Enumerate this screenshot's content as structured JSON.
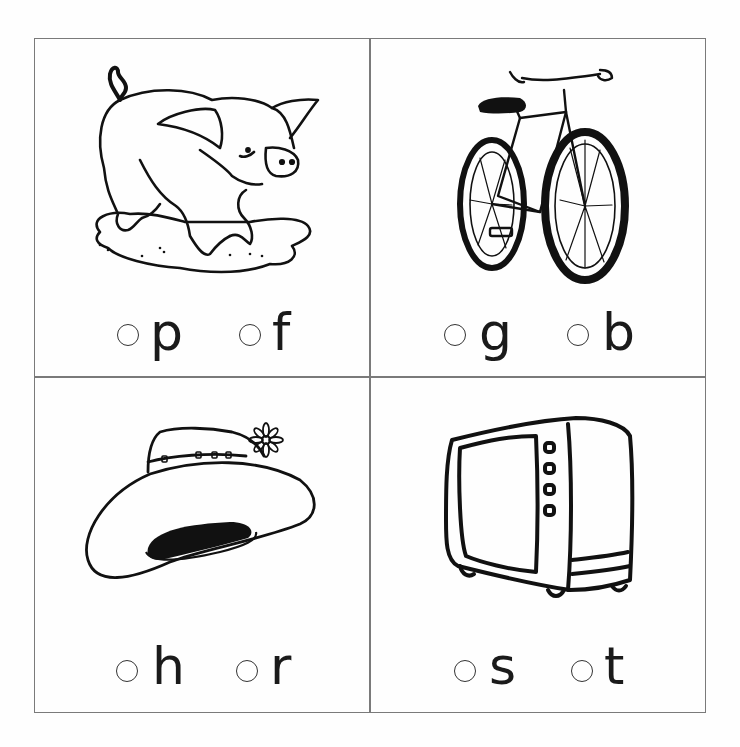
{
  "worksheet": {
    "panels": [
      {
        "id": "pig",
        "picture": "pig-in-mud",
        "options": [
          {
            "letter": "p"
          },
          {
            "letter": "f"
          }
        ]
      },
      {
        "id": "bike",
        "picture": "bicycle",
        "options": [
          {
            "letter": "g"
          },
          {
            "letter": "b"
          }
        ]
      },
      {
        "id": "hat",
        "picture": "hat-with-flower",
        "options": [
          {
            "letter": "h"
          },
          {
            "letter": "r"
          }
        ]
      },
      {
        "id": "tv",
        "picture": "television",
        "options": [
          {
            "letter": "s"
          },
          {
            "letter": "t"
          }
        ]
      }
    ],
    "colors": {
      "grid_line": "#7a7a7a",
      "ink": "#111111",
      "paper": "#fefefe"
    }
  }
}
